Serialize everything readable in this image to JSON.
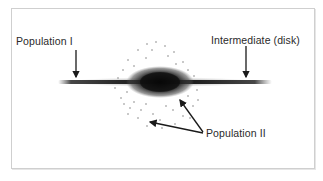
{
  "figure": {
    "labels": {
      "population_one": "Population I",
      "intermediate": "Intermediate (disk)",
      "population_two": "Population II"
    },
    "colors": {
      "frame_border": "#cfcfcf",
      "ink": "#1a1a1a",
      "text": "#2a2a2a",
      "background": "#ffffff"
    },
    "components": [
      {
        "name": "thin disk",
        "label_ref": "population_one"
      },
      {
        "name": "thick disk",
        "label_ref": "intermediate"
      },
      {
        "name": "central bulge",
        "label_ref": "population_two"
      },
      {
        "name": "halo stars (dots)",
        "label_ref": "population_two"
      }
    ]
  }
}
